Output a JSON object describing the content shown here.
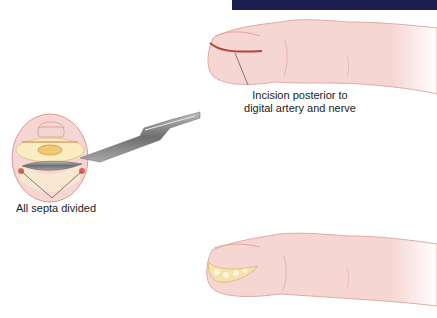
{
  "figure": {
    "header_bar_color": "#1c1f4f",
    "skin_color": "#f6d6d2",
    "skin_outline_color": "#d99a92",
    "incision_color": "#b9403c",
    "pus_color": "#f3e2b0",
    "blade_color": "#8a8a8a",
    "panels": [
      {
        "name": "finger-lateral-incision",
        "annotation": "Incision posterior to digital artery and nerve"
      },
      {
        "name": "cross-section-septa",
        "annotation": "All septa divided"
      },
      {
        "name": "finger-drained",
        "annotation": ""
      }
    ]
  },
  "labels": {
    "incision_line1": "Incision posterior to",
    "incision_line2": "digital artery and nerve",
    "septa": "All septa divided"
  }
}
